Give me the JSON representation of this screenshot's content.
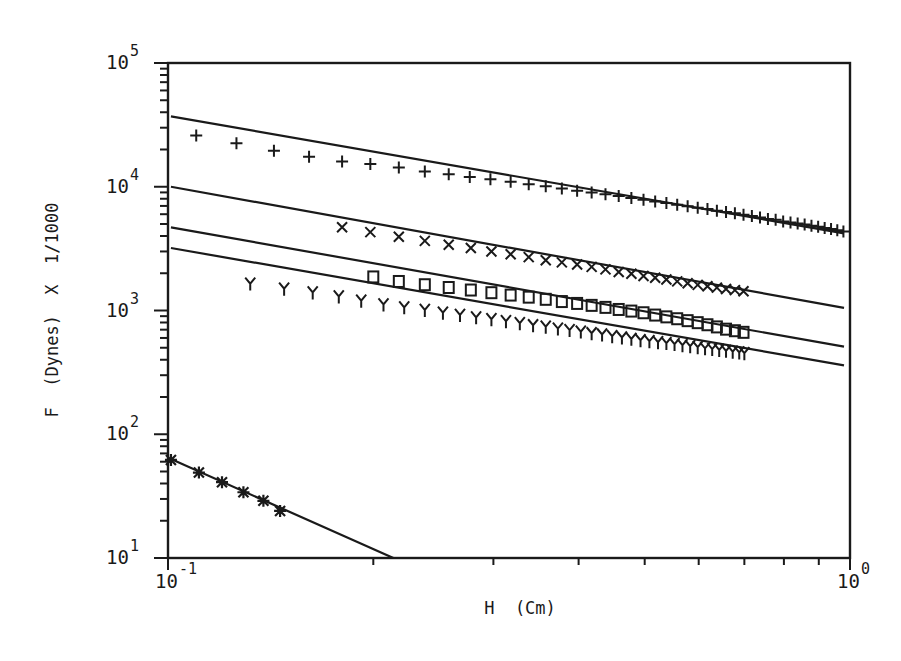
{
  "chart_data": {
    "type": "scatter",
    "title": "",
    "xlabel": "H  (Cm)",
    "ylabel": "F  (Dynes)  X  1/1000",
    "xscale": "log",
    "yscale": "log",
    "xlim": [
      0.1,
      1.0
    ],
    "ylim": [
      10,
      100000
    ],
    "grid": false,
    "legend": "none",
    "x_ticks": [
      {
        "value": 0.1,
        "base": "10",
        "exp": "-1"
      },
      {
        "value": 1.0,
        "base": "10",
        "exp": "0"
      }
    ],
    "y_ticks": [
      {
        "value": 10,
        "base": "10",
        "exp": "1"
      },
      {
        "value": 100,
        "base": "10",
        "exp": "2"
      },
      {
        "value": 1000,
        "base": "10",
        "exp": "3"
      },
      {
        "value": 10000,
        "base": "10",
        "exp": "4"
      },
      {
        "value": 100000,
        "base": "10",
        "exp": "5"
      }
    ],
    "series": [
      {
        "name": "plus",
        "marker": "+",
        "fit_line": {
          "x": [
            0.101,
            0.98
          ],
          "y": [
            37000,
            4200
          ]
        },
        "points": {
          "x": [
            0.11,
            0.126,
            0.143,
            0.161,
            0.18,
            0.198,
            0.218,
            0.238,
            0.258,
            0.277,
            0.297,
            0.318,
            0.338,
            0.358,
            0.378,
            0.398,
            0.418,
            0.438,
            0.458,
            0.478,
            0.498,
            0.518,
            0.538,
            0.558,
            0.578,
            0.598,
            0.618,
            0.638,
            0.658,
            0.678,
            0.698,
            0.718,
            0.738,
            0.758,
            0.778,
            0.798,
            0.818,
            0.838,
            0.858,
            0.878,
            0.898,
            0.918,
            0.938,
            0.958,
            0.978
          ],
          "y": [
            26000,
            22500,
            19500,
            17500,
            16000,
            15300,
            14300,
            13300,
            12600,
            12000,
            11500,
            11000,
            10500,
            10100,
            9700,
            9300,
            9000,
            8700,
            8400,
            8100,
            7850,
            7600,
            7400,
            7150,
            6950,
            6750,
            6600,
            6400,
            6250,
            6100,
            5950,
            5800,
            5650,
            5500,
            5400,
            5250,
            5150,
            5050,
            4950,
            4850,
            4750,
            4650,
            4550,
            4450,
            4350
          ]
        }
      },
      {
        "name": "x",
        "marker": "x",
        "fit_line": {
          "x": [
            0.101,
            0.98
          ],
          "y": [
            10000,
            1050
          ]
        },
        "points": {
          "x": [
            0.18,
            0.198,
            0.218,
            0.238,
            0.258,
            0.278,
            0.298,
            0.318,
            0.338,
            0.358,
            0.378,
            0.398,
            0.418,
            0.438,
            0.458,
            0.478,
            0.498,
            0.518,
            0.538,
            0.558,
            0.578,
            0.598,
            0.618,
            0.638,
            0.658,
            0.678,
            0.698
          ],
          "y": [
            4700,
            4300,
            3950,
            3650,
            3400,
            3200,
            3000,
            2850,
            2700,
            2550,
            2450,
            2350,
            2250,
            2150,
            2050,
            1980,
            1900,
            1840,
            1780,
            1720,
            1660,
            1610,
            1570,
            1530,
            1490,
            1460,
            1430
          ]
        }
      },
      {
        "name": "square",
        "marker": "□",
        "fit_line": {
          "x": [
            0.101,
            0.98
          ],
          "y": [
            4700,
            510
          ]
        },
        "points": {
          "x": [
            0.2,
            0.218,
            0.238,
            0.258,
            0.278,
            0.298,
            0.318,
            0.338,
            0.358,
            0.378,
            0.398,
            0.418,
            0.438,
            0.458,
            0.478,
            0.498,
            0.518,
            0.538,
            0.558,
            0.578,
            0.598,
            0.618,
            0.638,
            0.658,
            0.678,
            0.698
          ],
          "y": [
            1850,
            1700,
            1600,
            1520,
            1450,
            1380,
            1320,
            1270,
            1220,
            1170,
            1130,
            1090,
            1050,
            1010,
            980,
            950,
            910,
            880,
            850,
            820,
            790,
            760,
            730,
            700,
            680,
            660
          ]
        }
      },
      {
        "name": "y",
        "marker": "Y",
        "fit_line": {
          "x": [
            0.101,
            0.98
          ],
          "y": [
            3200,
            360
          ]
        },
        "points": {
          "x": [
            0.132,
            0.148,
            0.163,
            0.178,
            0.192,
            0.207,
            0.222,
            0.238,
            0.253,
            0.268,
            0.283,
            0.298,
            0.313,
            0.328,
            0.343,
            0.358,
            0.373,
            0.388,
            0.403,
            0.418,
            0.433,
            0.448,
            0.463,
            0.478,
            0.493,
            0.508,
            0.523,
            0.538,
            0.553,
            0.568,
            0.583,
            0.598,
            0.613,
            0.628,
            0.643,
            0.658,
            0.673,
            0.688,
            0.7
          ],
          "y": [
            1650,
            1500,
            1400,
            1300,
            1200,
            1120,
            1060,
            1010,
            960,
            920,
            880,
            850,
            820,
            790,
            760,
            740,
            715,
            695,
            675,
            655,
            640,
            620,
            605,
            590,
            575,
            565,
            555,
            545,
            535,
            525,
            515,
            505,
            495,
            488,
            480,
            472,
            465,
            458,
            452
          ]
        }
      },
      {
        "name": "asterisk",
        "marker": "✱",
        "fit_line": {
          "x": [
            0.101,
            0.214
          ],
          "y": [
            63,
            10
          ]
        },
        "points": {
          "x": [
            0.101,
            0.111,
            0.12,
            0.129,
            0.138,
            0.146
          ],
          "y": [
            62,
            49,
            41,
            34,
            29,
            24
          ]
        }
      }
    ]
  }
}
